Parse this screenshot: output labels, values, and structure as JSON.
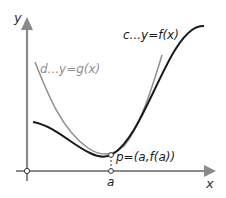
{
  "diagram": {
    "axes": {
      "x_label": "x",
      "y_label": "y",
      "axis_color": "#8a8a8a"
    },
    "curves": {
      "f": {
        "label": "c...y=f(x)",
        "color": "#1a1a1a"
      },
      "g": {
        "label": "d...y=g(x)",
        "color": "#8f8f8f"
      }
    },
    "point": {
      "label": "p=(a,f(a))",
      "a_label": "a"
    }
  }
}
